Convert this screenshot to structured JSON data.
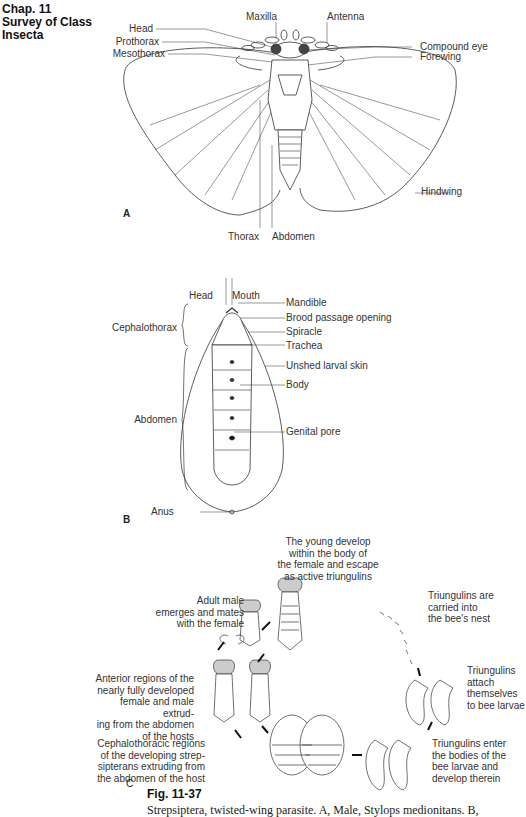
{
  "header": {
    "chapter": "Chap. 11",
    "section_line1": "Survey of Class",
    "section_line2": "Insecta"
  },
  "panel_a": {
    "letter": "A",
    "labels": {
      "maxilla": "Maxilla",
      "antenna": "Antenna",
      "head": "Head",
      "prothorax": "Prothorax",
      "mesothorax": "Mesothorax",
      "compound_eye": "Compound eye",
      "forewing": "Forewing",
      "hindwing": "Hindwing",
      "thorax": "Thorax",
      "abdomen": "Abdomen"
    }
  },
  "panel_b": {
    "letter": "B",
    "labels": {
      "head": "Head",
      "mouth": "Mouth",
      "mandible": "Mandible",
      "brood_passage": "Brood passage opening",
      "cephalothorax": "Cephalothorax",
      "spiracle": "Spiracle",
      "trachea": "Trachea",
      "unshed_skin": "Unshed larval skin",
      "abdomen": "Abdomen",
      "body": "Body",
      "genital_pore": "Genital pore",
      "anus": "Anus"
    }
  },
  "panel_c": {
    "letter": "C",
    "notes": {
      "young_develop": "The young develop\nwithin the body of\nthe female and escape\nas active triungulins",
      "adult_male": "Adult male\nemerges and mates\nwith the female",
      "carried": "Triungulins are\ncarried into\nthe bee's nest",
      "attach": "Triungulins\nattach\nthemselves\nto bee larvae",
      "anterior": "Anterior regions of the\nnearly fully developed\nfemale and male extrud-\ning from the abdomen\nof the hosts",
      "enter": "Triungulins enter\nthe bodies of the\nbee larvae and\ndevelop therein",
      "cephalothoracic": "Cephalothoracic regions\nof the developing strep-\nsipterans extruding from\nthe abdomen of the host"
    }
  },
  "figure": {
    "number": "Fig. 11-37",
    "caption": "Strepsiptera, twisted-wing parasite. A, Male, Stylops medionitans. B,"
  }
}
